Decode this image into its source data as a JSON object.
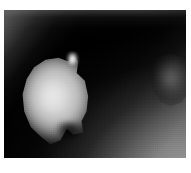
{
  "image": {
    "title": "Grayscale blob image",
    "description": "Low-light grayscale photograph: a large diffuse bright blob on the left over a black field, a faint dimmer blob at the right edge, a soft haze in the upper-left corner and a gray gradient ramp rising into the lower-right corner.",
    "kind": "grayscale-photograph",
    "width_px": 191,
    "height_px": 173,
    "color_mode": "grayscale",
    "page_background": "#ffffff",
    "plate": {
      "label": "image plate",
      "left_px": 4,
      "top_px": 10,
      "width_px": 182,
      "height_px": 148,
      "background": "#000000"
    },
    "margins": {
      "left_px": 4,
      "top_px": 10,
      "right_px": 5,
      "bottom_px": 15,
      "color": "#ffffff"
    },
    "palette": {
      "background_black": "#000000",
      "blob_highlight": "#f4f4f4",
      "blob_core": "#e0e0e0",
      "blob_body": "#c4c4c4",
      "blob_edge": "#6c6c6c",
      "secondary_blob": "#545454",
      "haze_gray": "#767676",
      "ramp_gray": "#969696",
      "corner_gray": "#b2b2b2",
      "page_white": "#ffffff"
    },
    "regions": [
      {
        "name": "primary-blob",
        "label": "Primary bright blob",
        "position": "left of centre",
        "center_px": [
          53,
          90
        ],
        "width_px": 82,
        "height_px": 96,
        "peak_gray": 234,
        "mean_gray": 196,
        "shape": "irregular rounded polygon with a notched lower edge"
      },
      {
        "name": "primary-blob-spike",
        "label": "Bright spike on upper-right shoulder",
        "center_px": [
          68,
          50
        ],
        "width_px": 13,
        "height_px": 17,
        "peak_gray": 244
      },
      {
        "name": "primary-blob-notch",
        "label": "Dark notch in lower edge",
        "center_px": [
          65,
          122
        ],
        "width_px": 26,
        "height_px": 20,
        "peak_gray": 18
      },
      {
        "name": "secondary-blob",
        "label": "Dim secondary blob at right edge",
        "center_px": [
          167,
          70
        ],
        "width_px": 50,
        "height_px": 60,
        "peak_gray": 104,
        "mean_gray": 62
      },
      {
        "name": "haze-top-left",
        "label": "Diagonal haze from upper-left corner",
        "direction": "128deg",
        "peak_gray": 118
      },
      {
        "name": "ramp-bottom-right",
        "label": "Gray gradient ramp toward lower-right corner",
        "direction": "312deg",
        "peak_gray": 178
      },
      {
        "name": "dark-field",
        "label": "Black background field",
        "mean_gray": 6
      }
    ],
    "texture": {
      "grain": "fine sensor grain",
      "blocks": "visible pixellation / macroblocking"
    }
  }
}
